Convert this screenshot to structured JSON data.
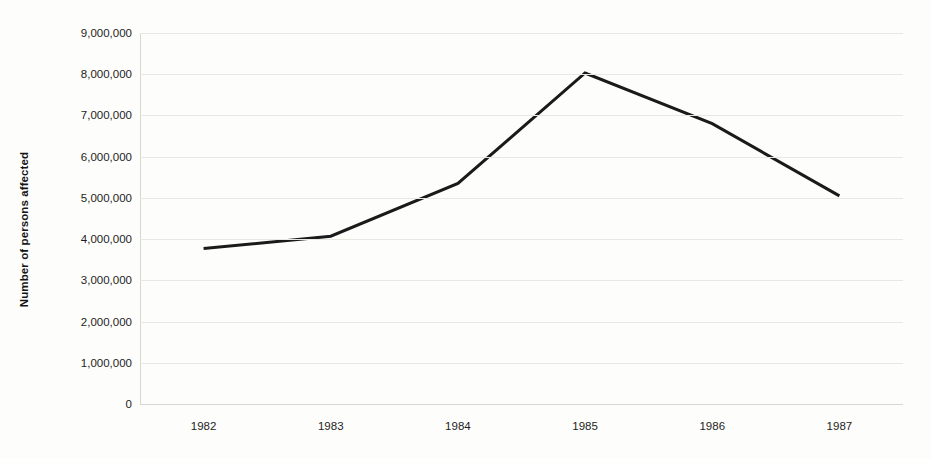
{
  "chart_data": {
    "type": "line",
    "title": "",
    "subtitle": "",
    "xlabel": "",
    "ylabel": "Number of persons affected",
    "categories": [
      "1982",
      "1983",
      "1984",
      "1985",
      "1986",
      "1987"
    ],
    "x": [
      1982,
      1983,
      1984,
      1985,
      1986,
      1987
    ],
    "values": [
      3770000,
      4070000,
      5350000,
      8030000,
      6800000,
      5050000
    ],
    "series": [
      {
        "name": "Number of persons affected",
        "values": [
          3770000,
          4070000,
          5350000,
          8030000,
          6800000,
          5050000
        ]
      }
    ],
    "ylim": [
      0,
      9000000
    ],
    "y_tick_values": [
      0,
      1000000,
      2000000,
      3000000,
      4000000,
      5000000,
      6000000,
      7000000,
      8000000,
      9000000
    ],
    "y_tick_labels": [
      "0",
      "1,000,000",
      "2,000,000",
      "3,000,000",
      "4,000,000",
      "5,000,000",
      "6,000,000",
      "7,000,000",
      "8,000,000",
      "9,000,000"
    ],
    "x_tick_labels": [
      "1982",
      "1983",
      "1984",
      "1985",
      "1986",
      "1987"
    ],
    "grid": true,
    "grid_axis": "y",
    "legend": false,
    "legend_position": "none",
    "annotations": [],
    "colors": {
      "background": "#fdfdfb",
      "series_line": "#1a1a1a",
      "gridline": "#e9e7e1",
      "axis_line": "#d8d6d0",
      "tick_text": "#1d1d1d",
      "axis_title": "#151515"
    },
    "line_width_px": 3
  }
}
